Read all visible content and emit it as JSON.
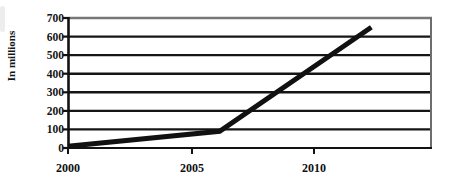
{
  "chart_data": {
    "type": "line",
    "title": "",
    "subtitle": "",
    "xlabel": "",
    "ylabel": "In millions",
    "x": [
      2000,
      2005,
      2010
    ],
    "values": [
      10,
      90,
      650
    ],
    "series": [
      {
        "name": "",
        "values": [
          10,
          90,
          650
        ]
      }
    ],
    "categories": [
      "2000",
      "2005",
      "2010"
    ],
    "x_tick_labels": [
      "2000",
      "2005",
      "2010"
    ],
    "y_tick_labels": [
      "0",
      "100",
      "200",
      "300",
      "400",
      "500",
      "600",
      "700"
    ],
    "y_ticks": [
      0,
      100,
      200,
      300,
      400,
      500,
      600,
      700
    ],
    "ylim": [
      0,
      700
    ],
    "xlim": [
      2000,
      2012
    ],
    "grid": "horizontal",
    "legend": "none",
    "line_color": "#111111",
    "grid_color": "#1a1a1a",
    "plot_border_color": "#555555",
    "background_color": "#ffffff"
  },
  "chart": {
    "y_axis_title": "In millions",
    "icon_names": {
      "y_axis": "y-axis-line",
      "x_axis": "x-axis-line",
      "data_line": "data-line-series"
    }
  }
}
